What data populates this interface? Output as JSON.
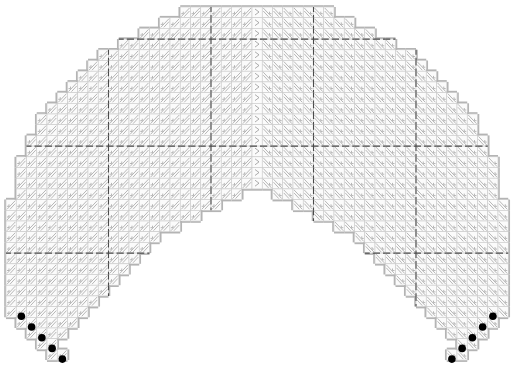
{
  "diagram": {
    "type": "stitch-chart",
    "grid": {
      "origin_x": 6,
      "origin_y": 7,
      "cell_w": 10.25,
      "cell_h": 10.7,
      "cols": 49,
      "rows": 33
    },
    "rows": [
      {
        "l": 17,
        "r": 31
      },
      {
        "l": 15,
        "r": 33
      },
      {
        "l": 13,
        "r": 35
      },
      {
        "l": 11,
        "r": 37
      },
      {
        "l": 9,
        "r": 39
      },
      {
        "l": 8,
        "r": 40
      },
      {
        "l": 7,
        "r": 41
      },
      {
        "l": 6,
        "r": 42
      },
      {
        "l": 5,
        "r": 43
      },
      {
        "l": 4,
        "r": 44
      },
      {
        "l": 3,
        "r": 45
      },
      {
        "l": 3,
        "r": 45
      },
      {
        "l": 2,
        "r": 46
      },
      {
        "l": 2,
        "r": 46
      },
      {
        "l": 1,
        "r": 47
      },
      {
        "l": 1,
        "r": 47
      },
      {
        "l": 1,
        "r": 47,
        "nl": 24,
        "nr": 24
      },
      {
        "l": 1,
        "r": 47,
        "nl": 22,
        "nr": 26
      },
      {
        "l": 0,
        "r": 48,
        "nl": 20,
        "nr": 28
      },
      {
        "l": 0,
        "r": 48,
        "nl": 18,
        "nr": 30
      },
      {
        "l": 0,
        "r": 48,
        "nl": 16,
        "nr": 32
      },
      {
        "l": 0,
        "r": 48,
        "nl": 14,
        "nr": 34
      },
      {
        "l": 0,
        "r": 48,
        "nl": 13,
        "nr": 35
      },
      {
        "l": 0,
        "r": 48,
        "nl": 12,
        "nr": 36
      },
      {
        "l": 0,
        "r": 48,
        "nl": 11,
        "nr": 37
      },
      {
        "l": 0,
        "r": 48,
        "nl": 10,
        "nr": 38
      },
      {
        "l": 0,
        "r": 48,
        "nl": 9,
        "nr": 39
      },
      {
        "l": 0,
        "r": 48,
        "nl": 8,
        "nr": 40
      },
      {
        "l": 0,
        "r": 48,
        "nl": 7,
        "nr": 41
      },
      {
        "l": 1,
        "r": 47,
        "nl": 6,
        "nr": 42
      },
      {
        "l": 2,
        "r": 46,
        "nl": 5,
        "nr": 43
      },
      {
        "l": 3,
        "r": 45,
        "nl": 4,
        "nr": 44
      },
      {
        "l": 4,
        "r": 44,
        "nl": 5,
        "nr": 43
      }
    ],
    "dashed_columns": [
      10,
      20,
      30,
      40
    ],
    "dashed_rows": [
      3,
      13,
      23
    ],
    "center_column": 24,
    "beads": [
      {
        "col": 1,
        "row": 29
      },
      {
        "col": 2,
        "row": 30
      },
      {
        "col": 3,
        "row": 31
      },
      {
        "col": 4,
        "row": 32
      },
      {
        "col": 5,
        "row": 33
      },
      {
        "col": 47,
        "row": 29
      },
      {
        "col": 46,
        "row": 30
      },
      {
        "col": 45,
        "row": 31
      },
      {
        "col": 44,
        "row": 32
      },
      {
        "col": 43,
        "row": 33
      }
    ],
    "colors": {
      "cell_fill": "#fbfbfb",
      "grid_line": "#c8c8c8",
      "hatch": "#9a9a9a",
      "outline": "#b4b4b4",
      "dash": "#4a4a4a",
      "bead": "#000000"
    }
  }
}
